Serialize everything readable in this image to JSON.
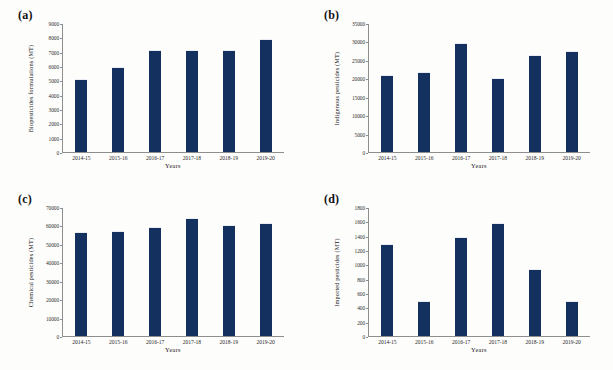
{
  "figure": {
    "background": "#fdfdfc",
    "bar_color": "#14305e",
    "axis_color": "#8e8e8e"
  },
  "chart_data": [
    {
      "type": "bar",
      "panel": "(a)",
      "title": "",
      "xlabel": "Years",
      "ylabel": "Biopesticides  formulations  (MT)",
      "categories": [
        "2014-15",
        "2015-16",
        "2016-17",
        "2017-18",
        "2018-19",
        "2019-20"
      ],
      "values": [
        5100,
        5950,
        7150,
        7100,
        7150,
        7850
      ],
      "ylim": [
        0,
        9000
      ],
      "yticks": [
        0,
        1000,
        2000,
        3000,
        4000,
        5000,
        6000,
        7000,
        8000,
        9000
      ],
      "ytick_labels": [
        "0",
        "1000",
        "2000",
        "3000",
        "4000",
        "5000",
        "6000",
        "7000",
        "8000",
        "9000"
      ],
      "grid": false,
      "legend": false
    },
    {
      "type": "bar",
      "panel": "(b)",
      "title": "",
      "xlabel": "Years",
      "ylabel": "Indigenous  pesticides  (MT)",
      "categories": [
        "2014-15",
        "2015-16",
        "2016-17",
        "2017-18",
        "2018-19",
        "2019-20"
      ],
      "values": [
        20900,
        21700,
        29500,
        20100,
        26300,
        27300
      ],
      "ylim": [
        0,
        35000
      ],
      "yticks": [
        0,
        5000,
        10000,
        15000,
        20000,
        25000,
        30000,
        35000
      ],
      "ytick_labels": [
        "0",
        "5000",
        "10000",
        "15000",
        "20000",
        "25000",
        "30000",
        "35000"
      ],
      "grid": false,
      "legend": false
    },
    {
      "type": "bar",
      "panel": "(c)",
      "title": "",
      "xlabel": "Years",
      "ylabel": "Chemical  pesticides  (MT)",
      "categories": [
        "2014-15",
        "2015-16",
        "2016-17",
        "2017-18",
        "2018-19",
        "2019-20"
      ],
      "values": [
        56500,
        57000,
        59000,
        64000,
        60200,
        61200
      ],
      "ylim": [
        0,
        70000
      ],
      "yticks": [
        0,
        10000,
        20000,
        30000,
        40000,
        50000,
        60000,
        70000
      ],
      "ytick_labels": [
        "0",
        "10000",
        "20000",
        "30000",
        "40000",
        "50000",
        "60000",
        "70000"
      ],
      "grid": false,
      "legend": false
    },
    {
      "type": "bar",
      "panel": "(d)",
      "title": "",
      "xlabel": "Years",
      "ylabel": "Imported  pesticides  (MT)",
      "categories": [
        "2014-15",
        "2015-16",
        "2016-17",
        "2017-18",
        "2018-19",
        "2019-20"
      ],
      "values": [
        1280,
        490,
        1380,
        1580,
        930,
        490
      ],
      "ylim": [
        0,
        1800
      ],
      "yticks": [
        0,
        200,
        400,
        600,
        800,
        1000,
        1200,
        1400,
        1600,
        1800
      ],
      "ytick_labels": [
        "0",
        "200",
        "400",
        "600",
        "800",
        "1000",
        "1200",
        "1400",
        "1600",
        "1800"
      ],
      "grid": false,
      "legend": false
    }
  ]
}
